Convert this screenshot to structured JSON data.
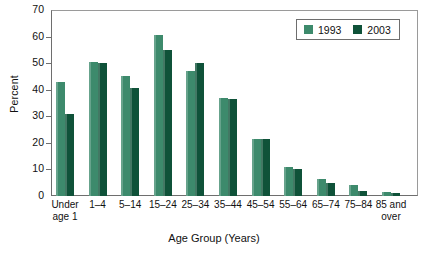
{
  "chart_data": {
    "type": "bar",
    "title": "",
    "xlabel": "Age Group (Years)",
    "ylabel": "Percent",
    "ylim": [
      0,
      70
    ],
    "yticks": [
      0,
      10,
      20,
      30,
      40,
      50,
      60,
      70
    ],
    "grid": false,
    "legend_position": "top-right",
    "categories": [
      "Under\nage 1",
      "1–4",
      "5–14",
      "15–24",
      "25–34",
      "35–44",
      "45–54",
      "55–64",
      "65–74",
      "75–84",
      "85 and\nover"
    ],
    "series": [
      {
        "name": "1993",
        "color": "#3d8a6c",
        "values": [
          43,
          50.5,
          45,
          60.5,
          47,
          37,
          21.5,
          11,
          6.5,
          4,
          1.5
        ]
      },
      {
        "name": "2003",
        "color": "#0f5239",
        "values": [
          31,
          50,
          40.5,
          55,
          50,
          36.5,
          21.5,
          10,
          5,
          2,
          1
        ]
      }
    ]
  },
  "legend": {
    "items": [
      {
        "label": "1993",
        "color": "#3d8a6c"
      },
      {
        "label": "2003",
        "color": "#0f5239"
      }
    ]
  }
}
